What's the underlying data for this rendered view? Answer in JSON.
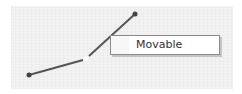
{
  "canvas": {
    "background": "#f2f2f2"
  },
  "connector": {
    "color": "#555555",
    "points": [
      {
        "x": 29,
        "y": 75,
        "type": "endpoint"
      },
      {
        "x": 86,
        "y": 59,
        "type": "midpoint-handle"
      },
      {
        "x": 135,
        "y": 14,
        "type": "endpoint"
      }
    ]
  },
  "tooltip": {
    "label": "Movable"
  }
}
